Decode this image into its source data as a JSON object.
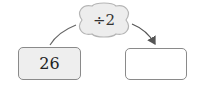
{
  "diagram": {
    "operation": {
      "label": "÷2",
      "shape": "cloud"
    },
    "input_box": {
      "value": "26"
    },
    "output_box": {
      "value": ""
    },
    "colors": {
      "box_border": "#8a8a8a",
      "input_fill": "#eeeeee",
      "cloud_fill": "#ededed",
      "arrow": "#555555"
    }
  }
}
